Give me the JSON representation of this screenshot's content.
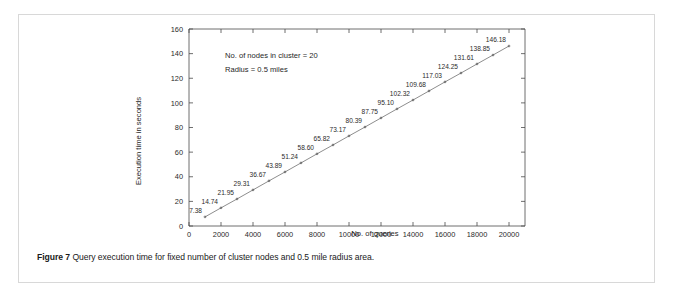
{
  "figure": {
    "caption_lead": "Figure 7",
    "caption_text": "Query execution time for fixed number of cluster nodes and 0.5 mile radius area."
  },
  "annotations": {
    "line1": "No. of nodes in cluster = 20",
    "line2": "Radius = 0.5 miles"
  },
  "colors": {
    "line": "#5b5b5b",
    "axis": "#4a4a4a",
    "text": "#1f1f1f",
    "card_border": "#d8d8d8",
    "background": "#ffffff"
  },
  "chart_data": {
    "type": "line",
    "title": "",
    "xlabel": "No. of queries",
    "ylabel": "Execution time in seconds",
    "xlim": [
      0,
      21000
    ],
    "ylim": [
      0,
      160
    ],
    "xticks": [
      0,
      2000,
      4000,
      6000,
      8000,
      10000,
      12000,
      14000,
      16000,
      18000,
      20000
    ],
    "xtick_labels": [
      "0",
      "2000",
      "4000",
      "6000",
      "8000",
      "10000",
      "12000",
      "14000",
      "16000",
      "18000",
      "20000"
    ],
    "yticks": [
      0,
      20,
      40,
      60,
      80,
      100,
      120,
      140,
      160
    ],
    "ytick_labels": [
      "0",
      "20",
      "40",
      "60",
      "80",
      "100",
      "120",
      "140",
      "160"
    ],
    "grid": false,
    "legend": false,
    "x": [
      1000,
      2000,
      3000,
      4000,
      5000,
      6000,
      7000,
      8000,
      9000,
      10000,
      11000,
      12000,
      13000,
      14000,
      15000,
      16000,
      17000,
      18000,
      19000,
      20000
    ],
    "values": [
      7.38,
      14.74,
      21.95,
      29.31,
      36.67,
      43.89,
      51.24,
      58.6,
      65.82,
      73.17,
      80.39,
      87.75,
      95.1,
      102.32,
      109.68,
      117.03,
      124.25,
      131.61,
      138.85,
      146.18
    ],
    "point_labels": [
      "7.38",
      "14.74",
      "21.95",
      "29.31",
      "36.67",
      "43.89",
      "51.24",
      "58.60",
      "65.82",
      "73.17",
      "80.39",
      "87.75",
      "95.10",
      "102.32",
      "109.68",
      "117.03",
      "124.25",
      "131.61",
      "138.85",
      "146.18"
    ],
    "series": [
      {
        "name": "Query execution time",
        "values": [
          7.38,
          14.74,
          21.95,
          29.31,
          36.67,
          43.89,
          51.24,
          58.6,
          65.82,
          73.17,
          80.39,
          87.75,
          95.1,
          102.32,
          109.68,
          117.03,
          124.25,
          131.61,
          138.85,
          146.18
        ]
      }
    ]
  }
}
